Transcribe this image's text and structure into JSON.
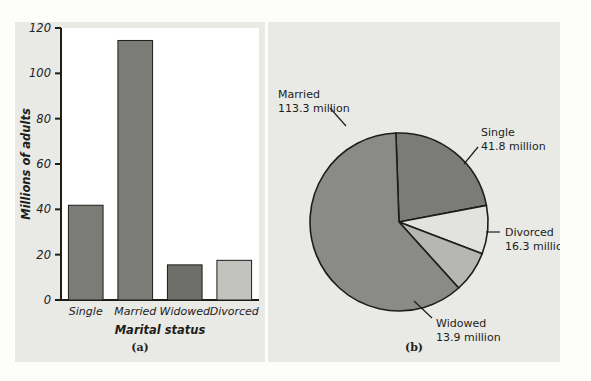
{
  "figure": {
    "background_color": "#e9e9e6",
    "page_color": "#fdfdfc"
  },
  "panel_a": {
    "caption": "(a)",
    "plot_background": "#ffffff",
    "chart_data": {
      "type": "bar",
      "title": "",
      "xlabel": "Marital status",
      "ylabel": "Millions of adults",
      "categories": [
        "Single",
        "Married",
        "Widowed",
        "Divorced"
      ],
      "values": [
        41.8,
        114.5,
        15.5,
        17.5
      ],
      "ylim": [
        0,
        120
      ],
      "yticks": [
        0,
        20,
        40,
        60,
        80,
        100,
        120
      ],
      "ytick_labels": [
        "0",
        "20",
        "40",
        "60",
        "80",
        "100",
        "120"
      ],
      "grid": false,
      "legend": "none",
      "bar_colors": [
        "#7b7b78",
        "#7b7b78",
        "#6e6e6b",
        "#c2c2bf"
      ],
      "bar_edge_color": "#1d1d1a"
    }
  },
  "panel_b": {
    "caption": "(b)",
    "chart_data": {
      "type": "pie",
      "title": "",
      "labels": [
        "Married",
        "Single",
        "Divorced",
        "Widowed"
      ],
      "values": [
        113.3,
        41.8,
        16.3,
        13.9
      ],
      "units": "million",
      "annotations": [
        {
          "name": "Married",
          "line1": "Married",
          "line2": "113.3 million"
        },
        {
          "name": "Single",
          "line1": "Single",
          "line2": "41.8 million"
        },
        {
          "name": "Divorced",
          "line1": "Divorced",
          "line2": "16.3 million"
        },
        {
          "name": "Widowed",
          "line1": "Widowed",
          "line2": "13.9 million"
        }
      ],
      "slice_colors": [
        "#8a8a87",
        "#7b7b78",
        "#e2e2df",
        "#b6b6b3"
      ],
      "edge_color": "#1d1d1a",
      "legend": "callout-labels"
    }
  }
}
